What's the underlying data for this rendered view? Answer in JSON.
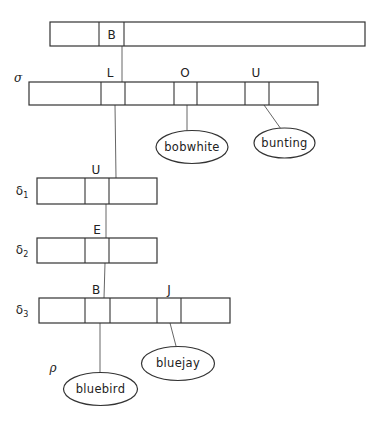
{
  "diagram": {
    "type": "trie",
    "nodes": {
      "root": {
        "key_label": "B"
      },
      "sigma": {
        "name": "σ",
        "key_labels": [
          "L",
          "O",
          "U"
        ]
      },
      "delta1": {
        "name": "δ",
        "subscript": "1",
        "key_label": "U"
      },
      "delta2": {
        "name": "δ",
        "subscript": "2",
        "key_label": "E"
      },
      "delta3": {
        "name": "δ",
        "subscript": "3",
        "key_labels": [
          "B",
          "J"
        ]
      },
      "rho": {
        "name": "ρ"
      }
    },
    "leaves": {
      "bobwhite": "bobwhite",
      "bunting": "bunting",
      "bluebird": "bluebird",
      "bluejay": "bluejay"
    },
    "edges": [
      {
        "from": "root.B",
        "to": "sigma"
      },
      {
        "from": "sigma.L",
        "to": "delta1"
      },
      {
        "from": "sigma.O",
        "to": "bobwhite"
      },
      {
        "from": "sigma.U",
        "to": "bunting"
      },
      {
        "from": "delta1.U",
        "to": "delta2"
      },
      {
        "from": "delta2.E",
        "to": "delta3"
      },
      {
        "from": "delta3.B",
        "to": "bluebird"
      },
      {
        "from": "delta3.J",
        "to": "bluejay"
      }
    ]
  }
}
